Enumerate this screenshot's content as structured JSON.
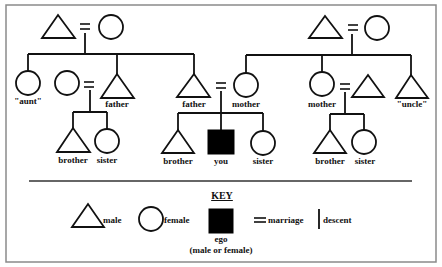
{
  "diagram": {
    "type": "kinship-chart",
    "nodes": {
      "gp_left_male": {
        "label": ""
      },
      "gp_left_female": {
        "label": ""
      },
      "aunt": {
        "label": "\"aunt\""
      },
      "father_left_wife": {
        "label": ""
      },
      "father_left": {
        "label": "father"
      },
      "father_center": {
        "label": "father"
      },
      "mother_center": {
        "label": "mother"
      },
      "gp_right_male": {
        "label": ""
      },
      "gp_right_female": {
        "label": ""
      },
      "mother_right": {
        "label": "mother"
      },
      "mother_right_husband": {
        "label": ""
      },
      "uncle": {
        "label": "\"uncle\""
      },
      "brother_left": {
        "label": "brother"
      },
      "sister_left": {
        "label": "sister"
      },
      "brother_center": {
        "label": "brother"
      },
      "you": {
        "label": "you"
      },
      "sister_center": {
        "label": "sister"
      },
      "brother_right": {
        "label": "brother"
      },
      "sister_right": {
        "label": "sister"
      }
    },
    "colors": {
      "stroke": "#111111",
      "ego_fill": "#000000",
      "frame": "#8a8a8a",
      "background": "#ffffff"
    }
  },
  "key": {
    "title": "KEY",
    "male": "male",
    "female": "female",
    "ego": "ego",
    "ego_note": "(male or female)",
    "marriage": "marriage",
    "descent": "descent"
  }
}
